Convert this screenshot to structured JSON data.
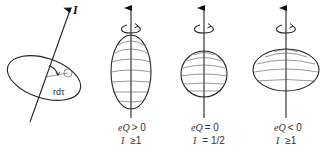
{
  "figure": {
    "colors": {
      "line": "#222222",
      "latitude": "#555555",
      "background": "#ffffff"
    }
  },
  "left_panel": {
    "axis_label": "I",
    "element_label": "rdτ"
  },
  "shapes": [
    {
      "id": "prolate",
      "shape": "prolate",
      "eq_label": "eQ > 0",
      "spin_label": "I  ≥1",
      "eq_part1": "eQ",
      "eq_rel": "> 0",
      "spin_part1": "I",
      "spin_rel": "≥1"
    },
    {
      "id": "spherical",
      "shape": "sphere",
      "eq_label": "eQ = 0",
      "spin_label": "I  = 1/2",
      "eq_part1": "eQ",
      "eq_rel": "= 0",
      "spin_part1": "I",
      "spin_rel": "= 1/2"
    },
    {
      "id": "oblate",
      "shape": "oblate",
      "eq_label": "eQ < 0",
      "spin_label": "I  ≥1",
      "eq_part1": "eQ",
      "eq_rel": "< 0",
      "spin_part1": "I",
      "spin_rel": "≥1"
    }
  ]
}
